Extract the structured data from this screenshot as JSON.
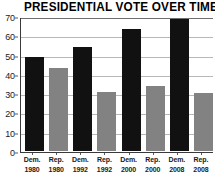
{
  "chart_data": {
    "type": "bar",
    "title": "PRESIDENTIAL VOTE OVER TIME",
    "xlabel": "",
    "ylabel": "",
    "ylim": [
      0,
      70
    ],
    "yticks": [
      0,
      10,
      20,
      30,
      40,
      50,
      60,
      70
    ],
    "grid": true,
    "legend": "none",
    "categories": [
      "Dem. 1980",
      "Rep. 1980",
      "Dem. 1992",
      "Rep. 1992",
      "Dem. 2000",
      "Rep. 2000",
      "Dem. 2008",
      "Rep. 2008"
    ],
    "values": [
      48.5,
      43,
      53.5,
      30.5,
      63,
      33.5,
      68,
      30
    ],
    "bars": [
      {
        "party": "Dem.",
        "year": "1980",
        "value": 48.5,
        "color": "#111111"
      },
      {
        "party": "Rep.",
        "year": "1980",
        "value": 43,
        "color": "#828282"
      },
      {
        "party": "Dem.",
        "year": "1992",
        "value": 53.5,
        "color": "#111111"
      },
      {
        "party": "Rep.",
        "year": "1992",
        "value": 30.5,
        "color": "#828282"
      },
      {
        "party": "Dem.",
        "year": "2000",
        "value": 63,
        "color": "#111111"
      },
      {
        "party": "Rep.",
        "year": "2000",
        "value": 33.5,
        "color": "#828282"
      },
      {
        "party": "Dem.",
        "year": "2008",
        "value": 68,
        "color": "#111111"
      },
      {
        "party": "Rep.",
        "year": "2008",
        "value": 30,
        "color": "#828282"
      }
    ],
    "colors": {
      "democrat_bar": "#111111",
      "republican_bar": "#828282",
      "gridline": "#b8b8b8",
      "axis": "#3a3a3a",
      "text": "#1a1a1a",
      "background": "#ffffff"
    }
  }
}
